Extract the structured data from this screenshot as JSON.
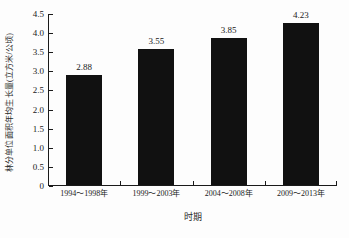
{
  "chart_data": {
    "type": "bar",
    "title": "",
    "xlabel": "时期",
    "ylabel": "林分单位面积年均生长量(立方米/公顷)",
    "categories": [
      "1994～1998年",
      "1999～2003年",
      "2004～2008年",
      "2009～2013年"
    ],
    "values": [
      2.88,
      3.55,
      3.85,
      4.23
    ],
    "value_labels": [
      "2.88",
      "3.55",
      "3.85",
      "4.23"
    ],
    "ylim": [
      0,
      4.5
    ],
    "ytick_labels": [
      "0",
      "0.5",
      "1.0",
      "1.5",
      "2.0",
      "2.5",
      "3.0",
      "3.5",
      "4.0",
      "4.5"
    ],
    "ytick_values": [
      0,
      0.5,
      1.0,
      1.5,
      2.0,
      2.5,
      3.0,
      3.5,
      4.0,
      4.5
    ],
    "grid": false,
    "legend": false,
    "bar_color": "#111111",
    "axis_color": "#1a1a1a",
    "background_color": "#fdfdfd"
  }
}
